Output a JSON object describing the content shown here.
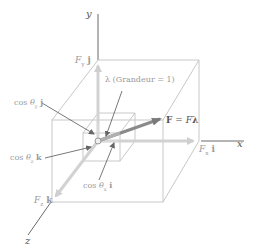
{
  "diagram": {
    "type": "3d-vector-components",
    "axes": {
      "y_label": "y",
      "x_label": "x",
      "z_label": "z"
    },
    "labels": {
      "fy_j": "Fᵧ j",
      "fx_i": "Fₓ i",
      "fz_k": "F_z k",
      "cos_y_j": "cos θᵧ j",
      "cos_z_k": "cos θ_z k",
      "cos_x_i": "cos θₓ i",
      "lambda": "λ (Grandeur = 1)",
      "force": "F = Fλ"
    },
    "colors": {
      "axis": "#6a6a6a",
      "box": "#c8c8c8",
      "component_arrow": "#cfcfcf",
      "force_arrow": "#808080",
      "text_dark": "#555555",
      "text_gray": "#9a9a9a"
    }
  }
}
